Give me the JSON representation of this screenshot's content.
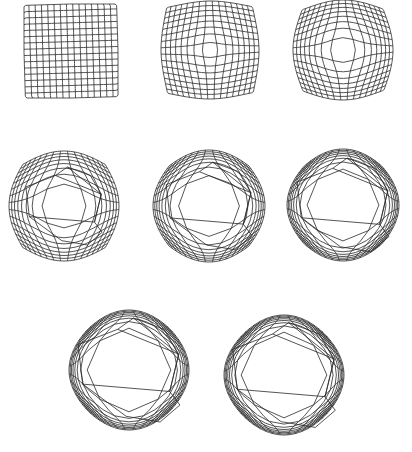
{
  "figure": {
    "background": "#ffffff",
    "stroke_color": "#2a2a2a",
    "grid_cells": 15,
    "panels": [
      {
        "id": "step-1",
        "cx": 71,
        "cy": 51,
        "half": 47,
        "strength": 0.0,
        "bulge": 0.0,
        "poly": 0.0,
        "rot": -0.03
      },
      {
        "id": "step-2",
        "cx": 210,
        "cy": 50,
        "half": 49,
        "strength": 0.35,
        "bulge": 0.04,
        "poly": 0.0,
        "rot": -0.02
      },
      {
        "id": "step-3",
        "cx": 343,
        "cy": 50,
        "half": 50,
        "strength": 0.55,
        "bulge": 0.07,
        "poly": 0.0,
        "rot": -0.02
      },
      {
        "id": "step-4",
        "cx": 64,
        "cy": 206,
        "half": 55,
        "strength": 0.75,
        "bulge": 0.1,
        "poly": 0.55,
        "rot": 0.0
      },
      {
        "id": "step-5",
        "cx": 209,
        "cy": 206,
        "half": 56,
        "strength": 0.88,
        "bulge": 0.12,
        "poly": 0.75,
        "rot": 0.0
      },
      {
        "id": "step-6",
        "cx": 343,
        "cy": 205,
        "half": 56,
        "strength": 0.95,
        "bulge": 0.13,
        "poly": 0.9,
        "rot": 0.0
      },
      {
        "id": "step-7",
        "cx": 129,
        "cy": 370,
        "half": 60,
        "strength": 0.985,
        "bulge": 0.14,
        "poly": 0.98,
        "rot": 0.0
      },
      {
        "id": "step-8",
        "cx": 284,
        "cy": 375,
        "half": 60,
        "strength": 0.995,
        "bulge": 0.14,
        "poly": 1.0,
        "rot": 0.0
      }
    ],
    "polygon": [
      [
        0.08,
        -0.92
      ],
      [
        0.62,
        -0.72
      ],
      [
        0.88,
        -0.28
      ],
      [
        0.72,
        0.38
      ],
      [
        0.9,
        0.62
      ],
      [
        0.55,
        0.92
      ],
      [
        -0.05,
        0.82
      ],
      [
        -0.82,
        0.25
      ],
      [
        -0.9,
        -0.45
      ],
      [
        -0.2,
        -0.72
      ]
    ],
    "inner_edges": [
      [
        0,
        2
      ],
      [
        2,
        3
      ],
      [
        3,
        7
      ],
      [
        9,
        2
      ]
    ]
  }
}
